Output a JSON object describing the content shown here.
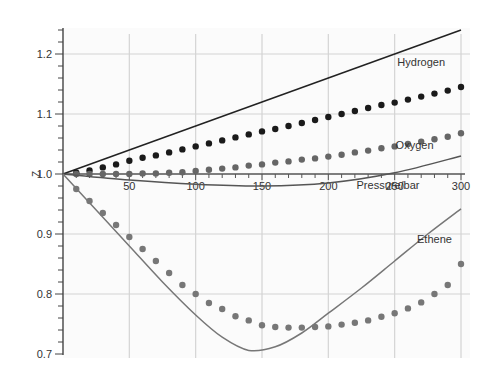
{
  "chart_data": {
    "type": "line",
    "title": "",
    "xlabel": "Pressure/bar",
    "ylabel": "Z",
    "xlim": [
      0,
      300
    ],
    "ylim": [
      0.7,
      1.25
    ],
    "x_ticks": [
      50,
      100,
      150,
      200,
      250,
      300
    ],
    "x_tick_labels": [
      "50",
      "100",
      "150",
      "200",
      "250",
      "300"
    ],
    "y_ticks": [
      0.7,
      0.8,
      0.9,
      1.0,
      1.1,
      1.2
    ],
    "y_tick_labels": [
      "0.7",
      "0.8",
      "0.9",
      "1.0",
      "1.1",
      "1.2"
    ],
    "grid": true,
    "legend": "inline labels",
    "series": [
      {
        "name": "Hydrogen",
        "style": "line",
        "color": "#222222",
        "x": [
          0,
          300
        ],
        "values": [
          1.0,
          1.24
        ]
      },
      {
        "name": "Hydrogen (data)",
        "style": "dots",
        "color": "#1a1a1a",
        "x": [
          10,
          20,
          30,
          40,
          50,
          60,
          70,
          80,
          90,
          100,
          110,
          120,
          130,
          140,
          150,
          160,
          170,
          180,
          190,
          200,
          210,
          220,
          230,
          240,
          250,
          260,
          270,
          280,
          290,
          300
        ],
        "values": [
          1.002,
          1.006,
          1.011,
          1.016,
          1.022,
          1.027,
          1.031,
          1.036,
          1.041,
          1.046,
          1.051,
          1.056,
          1.061,
          1.066,
          1.071,
          1.075,
          1.08,
          1.085,
          1.09,
          1.095,
          1.1,
          1.105,
          1.11,
          1.115,
          1.119,
          1.124,
          1.129,
          1.134,
          1.139,
          1.145
        ]
      },
      {
        "name": "Oxygen (data)",
        "style": "dots",
        "color": "#666666",
        "x": [
          10,
          20,
          30,
          40,
          50,
          60,
          70,
          80,
          90,
          100,
          110,
          120,
          130,
          140,
          150,
          160,
          170,
          180,
          190,
          200,
          210,
          220,
          230,
          240,
          250,
          260,
          270,
          280,
          290,
          300
        ],
        "values": [
          1.0,
          1.0,
          1.0,
          1.0,
          1.0,
          1.001,
          1.001,
          1.002,
          1.003,
          1.005,
          1.007,
          1.009,
          1.011,
          1.014,
          1.016,
          1.019,
          1.021,
          1.024,
          1.026,
          1.029,
          1.032,
          1.036,
          1.039,
          1.043,
          1.046,
          1.05,
          1.054,
          1.058,
          1.062,
          1.068
        ]
      },
      {
        "name": "Oxygen",
        "style": "line",
        "color": "#555555",
        "x": [
          0,
          50,
          100,
          150,
          200,
          250,
          300
        ],
        "values": [
          1.0,
          0.99,
          0.983,
          0.98,
          0.985,
          1.002,
          1.03
        ]
      },
      {
        "name": "Ethene (data)",
        "style": "dots",
        "color": "#777777",
        "x": [
          10,
          20,
          30,
          40,
          50,
          60,
          70,
          80,
          90,
          100,
          110,
          120,
          130,
          140,
          150,
          160,
          170,
          180,
          190,
          200,
          210,
          220,
          230,
          240,
          250,
          260,
          270,
          280,
          290,
          300
        ],
        "values": [
          0.975,
          0.955,
          0.935,
          0.915,
          0.895,
          0.875,
          0.855,
          0.835,
          0.815,
          0.8,
          0.785,
          0.775,
          0.763,
          0.756,
          0.748,
          0.745,
          0.744,
          0.744,
          0.745,
          0.746,
          0.749,
          0.752,
          0.756,
          0.762,
          0.768,
          0.776,
          0.786,
          0.8,
          0.815,
          0.85
        ]
      },
      {
        "name": "Ethene",
        "style": "line",
        "color": "#777777",
        "x": [
          0,
          25,
          50,
          75,
          100,
          120,
          140,
          160,
          180,
          200,
          225,
          250,
          275,
          300
        ],
        "values": [
          1.0,
          0.94,
          0.88,
          0.82,
          0.765,
          0.728,
          0.706,
          0.712,
          0.735,
          0.768,
          0.81,
          0.855,
          0.9,
          0.942
        ]
      }
    ],
    "annotations": [
      {
        "text": "Hydrogen",
        "x": 270,
        "y": 1.18
      },
      {
        "text": "Oxygen",
        "x": 265,
        "y": 1.042
      },
      {
        "text": "Pressure/bar",
        "x": 245,
        "y": 0.975
      },
      {
        "text": "Ethene",
        "x": 280,
        "y": 0.885
      }
    ]
  }
}
